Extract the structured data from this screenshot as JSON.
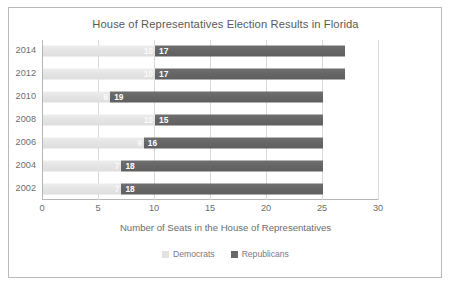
{
  "chart_data": {
    "type": "bar",
    "orientation": "horizontal",
    "stacked": true,
    "title": "House of Representatives Election Results in Florida",
    "xlabel": "Number of Seats in the House of Representatives",
    "ylabel": "",
    "categories": [
      "2014",
      "2012",
      "2010",
      "2008",
      "2006",
      "2004",
      "2002"
    ],
    "xlim": [
      0,
      30
    ],
    "xticks": [
      0,
      5,
      10,
      15,
      20,
      25,
      30
    ],
    "xtick_labels": [
      "0",
      "5",
      "10",
      "15",
      "20",
      "25",
      "30"
    ],
    "grid": true,
    "grid_axis": "x",
    "legend_position": "bottom",
    "series": [
      {
        "name": "Democrats",
        "color": "#e2e2e2",
        "values": [
          10,
          10,
          6,
          10,
          9,
          7,
          7
        ],
        "labels": [
          "10",
          "10",
          "6",
          "10",
          "9",
          "7",
          "7"
        ]
      },
      {
        "name": "Republicans",
        "color": "#676767",
        "values": [
          17,
          17,
          19,
          15,
          16,
          18,
          18
        ],
        "labels": [
          "17",
          "17",
          "19",
          "15",
          "16",
          "18",
          "18"
        ]
      }
    ],
    "totals": [
      27,
      27,
      25,
      25,
      25,
      25,
      25
    ]
  },
  "legend": {
    "items": [
      {
        "label": "Democrats",
        "swatch": "square-light-gray"
      },
      {
        "label": "Republicans",
        "swatch": "square-dark-gray"
      }
    ]
  },
  "colors": {
    "democrat": "#e2e2e2",
    "republican": "#676767",
    "grid": "#d9d9d9",
    "axis": "#b5b5b5",
    "text": "#6d6d6d",
    "title_text": "#5a5a5a",
    "border": "#b9b9b9",
    "background": "#ffffff"
  }
}
